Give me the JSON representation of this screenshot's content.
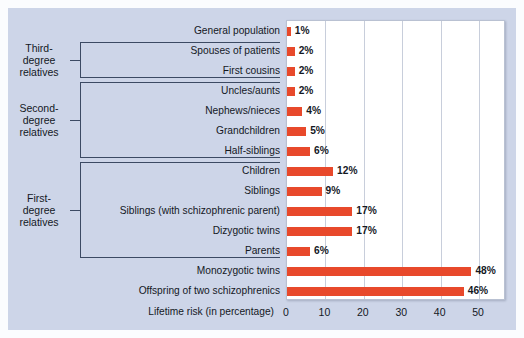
{
  "chart_data": {
    "type": "bar",
    "orientation": "horizontal",
    "title": "",
    "xlabel": "Lifetime risk (in percentage)",
    "ylabel": "",
    "xlim": [
      0,
      57
    ],
    "xticks": [
      0,
      10,
      20,
      30,
      40,
      50
    ],
    "xtick_labels": [
      "0",
      "10",
      "20",
      "30",
      "40",
      "50"
    ],
    "grid": "vertical",
    "legend": "none",
    "bar_color": "#e8492b",
    "categories": [
      "General population",
      "Spouses of patients",
      "First cousins",
      "Uncles/aunts",
      "Nephews/nieces",
      "Grandchildren",
      "Half-siblings",
      "Children",
      "Siblings",
      "Siblings (with schizophrenic parent)",
      "Dizygotic twins",
      "Parents",
      "Monozygotic twins",
      "Offspring of two schizophrenics"
    ],
    "values": [
      1,
      2,
      2,
      2,
      4,
      5,
      6,
      12,
      9,
      17,
      17,
      6,
      48,
      46
    ],
    "value_labels": [
      "1%",
      "2%",
      "2%",
      "2%",
      "4%",
      "5%",
      "6%",
      "12%",
      "9%",
      "17%",
      "17%",
      "6%",
      "48%",
      "46%"
    ]
  },
  "brackets": [
    {
      "label_lines": [
        "Third-",
        "degree",
        "relatives"
      ],
      "first_index": 1,
      "last_index": 2
    },
    {
      "label_lines": [
        "Second-",
        "degree",
        "relatives"
      ],
      "first_index": 3,
      "last_index": 6
    },
    {
      "label_lines": [
        "First-",
        "degree",
        "relatives"
      ],
      "first_index": 7,
      "last_index": 11
    }
  ],
  "colors": {
    "bar": "#e8492b",
    "panel_background": "#cdd5e8",
    "page_background": "#fbfcfe",
    "plot_background": "#ffffff",
    "gridline": "#c8cedb",
    "bracket_line": "#3c4a63",
    "text": "#14181f"
  }
}
